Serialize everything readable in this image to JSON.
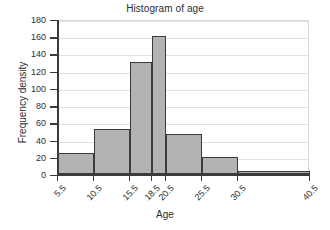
{
  "chart_data": {
    "type": "bar",
    "title": "Histogram of age",
    "xlabel": "Age",
    "ylabel": "Frequency density",
    "grid": true,
    "legend": "none",
    "xlim": [
      5.5,
      40.5
    ],
    "ylim": [
      0,
      180
    ],
    "ytick_labels": [
      "0",
      "20",
      "40",
      "60",
      "80",
      "100",
      "120",
      "140",
      "160",
      "180"
    ],
    "ytick_values": [
      0,
      20,
      40,
      60,
      80,
      100,
      120,
      140,
      160,
      180
    ],
    "xtick_labels": [
      "5.5",
      "10.5",
      "15.5",
      "18.5",
      "20.5",
      "25.5",
      "30.5",
      "40.5"
    ],
    "xtick_values": [
      5.5,
      10.5,
      15.5,
      18.5,
      20.5,
      25.5,
      30.5,
      40.5
    ],
    "bins": [
      {
        "label": "5.5-10.5",
        "x_start": 5.5,
        "x_end": 10.5,
        "value": 24
      },
      {
        "label": "10.5-15.5",
        "x_start": 10.5,
        "x_end": 15.5,
        "value": 52
      },
      {
        "label": "15.5-18.5",
        "x_start": 15.5,
        "x_end": 18.5,
        "value": 130
      },
      {
        "label": "18.5-20.5",
        "x_start": 18.5,
        "x_end": 20.5,
        "value": 160
      },
      {
        "label": "20.5-25.5",
        "x_start": 20.5,
        "x_end": 25.5,
        "value": 46
      },
      {
        "label": "25.5-30.5",
        "x_start": 25.5,
        "x_end": 30.5,
        "value": 20
      },
      {
        "label": "30.5-40.5",
        "x_start": 30.5,
        "x_end": 40.5,
        "value": 3
      }
    ],
    "categories": [
      "5.5-10.5",
      "10.5-15.5",
      "15.5-18.5",
      "18.5-20.5",
      "20.5-25.5",
      "25.5-30.5",
      "30.5-40.5"
    ],
    "values": [
      24,
      52,
      130,
      160,
      46,
      20,
      3
    ],
    "colors": {
      "bar_fill": "#b3b3b3",
      "bar_edge": "#3b3b3b",
      "grid": "#e2e2e2",
      "axis": "#3b3b3b",
      "text": "#2e2e2e",
      "background": "#ffffff"
    }
  }
}
